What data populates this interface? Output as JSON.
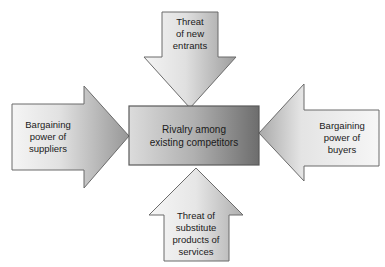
{
  "diagram": {
    "type": "porters-five-forces",
    "background_color": "#ffffff",
    "center": {
      "name": "rivalry",
      "lines": [
        "Rivalry among",
        "existing competitors"
      ],
      "shape": "rectangle",
      "fill_light": "#d9d9d9",
      "fill_dark": "#6f6f6f",
      "border_color": "#5a5a5a",
      "text_color": "#1a1a1a"
    },
    "forces": [
      {
        "name": "threat-of-new-entrants",
        "direction": "down",
        "position": "top",
        "lines": [
          "Threat",
          "of new",
          "entrants"
        ],
        "fill_light": "#f2f2f2",
        "fill_dark": "#9a9a9a",
        "border_color": "#6b6b6b",
        "text_color": "#1a1a1a"
      },
      {
        "name": "bargaining-power-of-suppliers",
        "direction": "right",
        "position": "left",
        "lines": [
          "Bargaining",
          "power of",
          "suppliers"
        ],
        "fill_light": "#f2f2f2",
        "fill_dark": "#9a9a9a",
        "border_color": "#6b6b6b",
        "text_color": "#1a1a1a"
      },
      {
        "name": "bargaining-power-of-buyers",
        "direction": "left",
        "position": "right",
        "lines": [
          "Bargaining",
          "power of",
          "buyers"
        ],
        "fill_light": "#f7f7f7",
        "fill_dark": "#a5a5a5",
        "border_color": "#6b6b6b",
        "text_color": "#1a1a1a"
      },
      {
        "name": "threat-of-substitute-products-or-services",
        "direction": "up",
        "position": "bottom",
        "lines": [
          "Threat of",
          "substitute",
          "products of",
          "services"
        ],
        "fill_light": "#f7f7f7",
        "fill_dark": "#a8a8a8",
        "border_color": "#6b6b6b",
        "text_color": "#1a1a1a"
      }
    ]
  }
}
